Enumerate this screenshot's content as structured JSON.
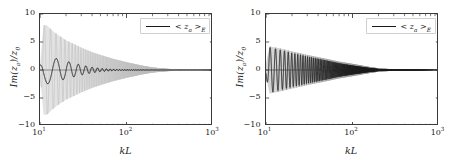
{
  "figure": {
    "width": 451,
    "height": 164,
    "background": "#ffffff",
    "panel_count": 2
  },
  "style": {
    "line_color": "#1a1a1a",
    "envelope_color": "#b9b9b9",
    "axis_color": "#3a3a3a",
    "legend_border": "#cfcfcf",
    "tick_color": "#222222"
  },
  "labels": {
    "ylabel_prefix": "Im(",
    "ylabel_var": "z",
    "ylabel_var_sub": "a",
    "ylabel_mid": ")/",
    "ylabel_denom": "z",
    "ylabel_denom_sub": "0",
    "xlabel": "kL",
    "legend_prefix": "< ",
    "legend_var": "z",
    "legend_var_sub": "a",
    "legend_suffix": " >",
    "legend_sub": "E"
  },
  "yticks": [
    {
      "value": 10,
      "label": "10"
    },
    {
      "value": 5,
      "label": "5"
    },
    {
      "value": 0,
      "label": "0"
    },
    {
      "value": -5,
      "label": "−5"
    },
    {
      "value": -10,
      "label": "−10"
    }
  ],
  "xticks": [
    {
      "value": 10,
      "mantissa": "10",
      "exponent": "1"
    },
    {
      "value": 100,
      "mantissa": "10",
      "exponent": "2"
    },
    {
      "value": 1000,
      "mantissa": "10",
      "exponent": "3"
    }
  ],
  "chart_data": [
    {
      "type": "line",
      "panel": "left",
      "title": "",
      "xlabel": "kL",
      "ylabel": "Im(z_a)/z_0",
      "xscale": "log",
      "xlim": [
        10,
        1000
      ],
      "ylim": [
        -10,
        10
      ],
      "grid": false,
      "legend_position": "upper right",
      "series": [
        {
          "name": "envelope",
          "role": "high-frequency oscillation envelope",
          "color": "#b9b9b9",
          "description": "Light gray rapidly oscillating resonance signal; amplitude peaks near kL=12 at about +/-8 and decays monotonically to 0 by kL~200",
          "envelope_points": [
            {
              "x": 10,
              "amp": 1.0
            },
            {
              "x": 11,
              "amp": 8.0
            },
            {
              "x": 12,
              "amp": 8.0
            },
            {
              "x": 14,
              "amp": 7.0
            },
            {
              "x": 16,
              "amp": 6.3
            },
            {
              "x": 18,
              "amp": 5.8
            },
            {
              "x": 20,
              "amp": 5.3
            },
            {
              "x": 25,
              "amp": 4.6
            },
            {
              "x": 30,
              "amp": 4.0
            },
            {
              "x": 40,
              "amp": 3.2
            },
            {
              "x": 50,
              "amp": 2.7
            },
            {
              "x": 70,
              "amp": 2.0
            },
            {
              "x": 100,
              "amp": 1.4
            },
            {
              "x": 150,
              "amp": 0.8
            },
            {
              "x": 200,
              "amp": 0.45
            },
            {
              "x": 300,
              "amp": 0.2
            },
            {
              "x": 500,
              "amp": 0.07
            },
            {
              "x": 1000,
              "amp": 0.0
            }
          ]
        },
        {
          "name": "< z_a >_E",
          "role": "ensemble average",
          "color": "#1a1a1a",
          "description": "Dark lower-frequency damped oscillation starting near -1 at kL=10, peaking about +2.5 near kL=12, decaying to 0 by kL~50",
          "envelope_points": [
            {
              "x": 10,
              "amp": 1.2
            },
            {
              "x": 11,
              "amp": 2.6
            },
            {
              "x": 12,
              "amp": 2.5
            },
            {
              "x": 14,
              "amp": 2.2
            },
            {
              "x": 16,
              "amp": 2.0
            },
            {
              "x": 18,
              "amp": 1.8
            },
            {
              "x": 20,
              "amp": 1.6
            },
            {
              "x": 25,
              "amp": 1.2
            },
            {
              "x": 30,
              "amp": 0.9
            },
            {
              "x": 40,
              "amp": 0.5
            },
            {
              "x": 50,
              "amp": 0.3
            },
            {
              "x": 70,
              "amp": 0.12
            },
            {
              "x": 100,
              "amp": 0.05
            },
            {
              "x": 1000,
              "amp": 0.0
            }
          ]
        }
      ]
    },
    {
      "type": "line",
      "panel": "right",
      "title": "",
      "xlabel": "kL",
      "ylabel": "Im(z_a)/z_0",
      "xscale": "log",
      "xlim": [
        10,
        1000
      ],
      "ylim": [
        -10,
        10
      ],
      "grid": false,
      "legend_position": "upper right",
      "series": [
        {
          "name": "envelope",
          "role": "high-frequency oscillation envelope",
          "color": "#8e8e8e",
          "description": "Dense gray oscillation starting about +/-4 near kL=12, decaying smoothly to a flat zero line by kL~200",
          "envelope_points": [
            {
              "x": 10,
              "amp": 1.2
            },
            {
              "x": 11,
              "amp": 4.2
            },
            {
              "x": 12,
              "amp": 4.1
            },
            {
              "x": 14,
              "amp": 3.9
            },
            {
              "x": 16,
              "amp": 3.7
            },
            {
              "x": 18,
              "amp": 3.5
            },
            {
              "x": 20,
              "amp": 3.3
            },
            {
              "x": 25,
              "amp": 3.0
            },
            {
              "x": 30,
              "amp": 2.7
            },
            {
              "x": 40,
              "amp": 2.3
            },
            {
              "x": 50,
              "amp": 2.0
            },
            {
              "x": 70,
              "amp": 1.5
            },
            {
              "x": 100,
              "amp": 1.1
            },
            {
              "x": 150,
              "amp": 0.6
            },
            {
              "x": 200,
              "amp": 0.3
            },
            {
              "x": 300,
              "amp": 0.12
            },
            {
              "x": 500,
              "amp": 0.04
            },
            {
              "x": 1000,
              "amp": 0.0
            }
          ]
        },
        {
          "name": "< z_a >_E",
          "role": "ensemble average",
          "color": "#1a1a1a",
          "description": "Dark damped oscillation overlying the gray band, from about +/-4 at kL=12 decaying to 0 by kL~150",
          "envelope_points": [
            {
              "x": 10,
              "amp": 1.2
            },
            {
              "x": 11,
              "amp": 4.0
            },
            {
              "x": 12,
              "amp": 3.9
            },
            {
              "x": 14,
              "amp": 3.6
            },
            {
              "x": 16,
              "amp": 3.4
            },
            {
              "x": 18,
              "amp": 3.2
            },
            {
              "x": 20,
              "amp": 3.0
            },
            {
              "x": 25,
              "amp": 2.7
            },
            {
              "x": 30,
              "amp": 2.4
            },
            {
              "x": 40,
              "amp": 2.0
            },
            {
              "x": 50,
              "amp": 1.7
            },
            {
              "x": 70,
              "amp": 1.2
            },
            {
              "x": 100,
              "amp": 0.8
            },
            {
              "x": 150,
              "amp": 0.4
            },
            {
              "x": 200,
              "amp": 0.18
            },
            {
              "x": 300,
              "amp": 0.06
            },
            {
              "x": 1000,
              "amp": 0.0
            }
          ]
        }
      ]
    }
  ]
}
